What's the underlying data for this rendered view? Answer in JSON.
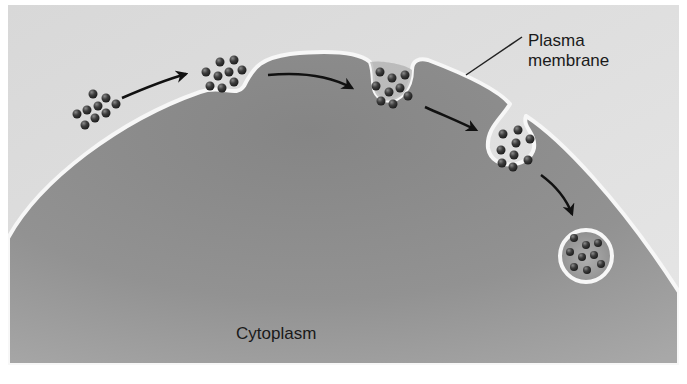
{
  "figure": {
    "labels": {
      "plasma_membrane_line1": "Plasma",
      "plasma_membrane_line2": "membrane",
      "cytoplasm": "Cytoplasm"
    },
    "stages": [
      {
        "id": "extracellular-particles",
        "description": "Particles outside cell"
      },
      {
        "id": "membrane-dimple",
        "description": "Particles contact membrane, shallow invagination"
      },
      {
        "id": "deep-pit",
        "description": "Membrane invaginates deeply"
      },
      {
        "id": "pinching-vesicle",
        "description": "Vesicle pinching off"
      },
      {
        "id": "free-vesicle",
        "description": "Vesicle free in cytoplasm"
      }
    ],
    "colors": {
      "background": "#ffffff",
      "extracellular": "#dcdcdc",
      "cytoplasm": "#8e8e8e",
      "membrane": "#f7f7f7",
      "particle": "#3a3a3a",
      "arrow": "#111111",
      "text": "#1a1a1a"
    }
  }
}
